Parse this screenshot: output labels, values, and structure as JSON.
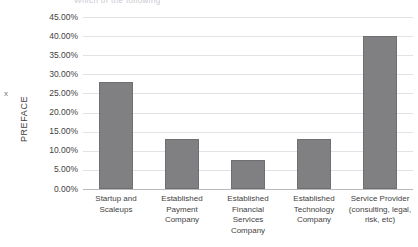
{
  "chart_data": {
    "type": "bar",
    "title": "",
    "xlabel": "",
    "ylabel": "PREFACE",
    "ylim": [
      0,
      45
    ],
    "grid": true,
    "legend": false,
    "categories": [
      "Startup and Scaleups",
      "Established Payment Company",
      "Established Financial Services Company",
      "Established Technology Company",
      "Service Provider (consulting, legal, risk, etc)"
    ],
    "values": [
      28.0,
      13.0,
      7.5,
      13.0,
      40.0
    ],
    "tick_labels": [
      "45.00%",
      "40.00%",
      "35.00%",
      "30.00%",
      "25.00%",
      "20.00%",
      "15.00%",
      "10.00%",
      "5.00%",
      "0.00%"
    ],
    "tick_values": [
      45,
      40,
      35,
      30,
      25,
      20,
      15,
      10,
      5,
      0
    ],
    "bar_color": "#808083",
    "bar_border_color": "#6f6f72",
    "gridline_color": "#e2e2e4",
    "axis_color": "#b9b9bc"
  },
  "axis": {
    "y_title": "PREFACE",
    "y_legend_marker": "x"
  },
  "header": {
    "clipped_title": "Which of the following"
  }
}
